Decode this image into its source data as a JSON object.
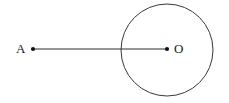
{
  "figure": {
    "canvas": {
      "width": 229,
      "height": 103,
      "background_color": "#ffffff"
    },
    "stroke_color": "#3a3a3a",
    "point_color": "#111111",
    "label_color": "#1a1a1a",
    "stroke_width": 1,
    "circle": {
      "name": "circle-O",
      "center_x": 167,
      "center_y": 50,
      "radius": 46
    },
    "points": [
      {
        "id": "A",
        "label": "A",
        "x": 33,
        "y": 49,
        "dot_radius": 2.1,
        "label_x": 16,
        "label_y": 42
      },
      {
        "id": "O",
        "label": "O",
        "x": 167,
        "y": 49,
        "dot_radius": 2.1,
        "label_x": 174,
        "label_y": 42
      }
    ],
    "segment": {
      "name": "segment-AO",
      "from": "A",
      "to": "O",
      "x1": 33,
      "y1": 49,
      "x2": 167,
      "y2": 49
    }
  },
  "chart_data": {
    "type": "diagram",
    "title": "",
    "elements": [
      {
        "kind": "circle",
        "label": "O",
        "center": [
          167,
          50
        ],
        "radius": 46
      },
      {
        "kind": "point",
        "label": "A",
        "position": [
          33,
          49
        ]
      },
      {
        "kind": "point",
        "label": "O",
        "position": [
          167,
          49
        ]
      },
      {
        "kind": "segment",
        "label": "AO",
        "endpoints": [
          [
            33,
            49
          ],
          [
            167,
            49
          ]
        ]
      }
    ],
    "labels": [
      "A",
      "O"
    ]
  }
}
